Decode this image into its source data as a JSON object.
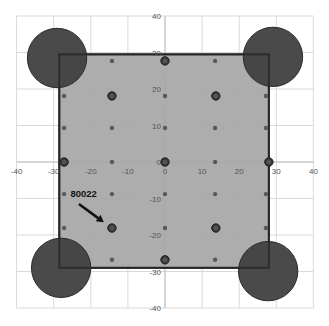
{
  "chart_data": {
    "type": "scatter",
    "title": "",
    "xlabel": "",
    "ylabel": "",
    "xlim": [
      -40,
      40
    ],
    "ylim": [
      -40,
      40
    ],
    "grid": true,
    "legend": null,
    "x_ticks": [
      -40,
      -30,
      -20,
      -10,
      0,
      10,
      20,
      30,
      40
    ],
    "y_ticks": [
      -40,
      -30,
      -20,
      -10,
      0,
      10,
      20,
      30,
      40
    ],
    "colors": {
      "grid": "#d9d9d9",
      "axis": "#bfbfbf",
      "square_fill": "#a6a6a6",
      "square_stroke": "#262626",
      "large_circle_fill": "#404040",
      "large_circle_stroke": "#2a2a2a",
      "small_dot": "#595959",
      "medium_dot": "#3a3a3a",
      "annotation": "#111111"
    },
    "square": {
      "x_min": -28.5,
      "x_max": 28,
      "y_min": -29,
      "y_max": 29.5
    },
    "series": [
      {
        "name": "large circles",
        "radius_units": 8,
        "points": [
          {
            "x": -29.1,
            "y": 28.5
          },
          {
            "x": 29.1,
            "y": 28.8
          },
          {
            "x": -28.0,
            "y": -29.0
          },
          {
            "x": 27.8,
            "y": -29.9
          }
        ]
      },
      {
        "name": "medium dots",
        "points": [
          {
            "x": 0,
            "y": 27.7
          },
          {
            "x": -14.3,
            "y": 18.1
          },
          {
            "x": 13.7,
            "y": 18.1
          },
          {
            "x": -27.2,
            "y": 0
          },
          {
            "x": 0,
            "y": 0
          },
          {
            "x": 28.0,
            "y": 0
          },
          {
            "x": -14.3,
            "y": -18.1
          },
          {
            "x": 13.7,
            "y": -18.1
          },
          {
            "x": 0,
            "y": -26.8
          }
        ]
      },
      {
        "name": "small dots",
        "points": [
          {
            "x": -14.3,
            "y": 27.7
          },
          {
            "x": 13.5,
            "y": 27.7
          },
          {
            "x": -27.2,
            "y": 18.1
          },
          {
            "x": 0,
            "y": 18.1
          },
          {
            "x": 27.2,
            "y": 18.1
          },
          {
            "x": -27.2,
            "y": 9.3
          },
          {
            "x": -14.3,
            "y": 9.3
          },
          {
            "x": 0,
            "y": 9.3
          },
          {
            "x": 13.5,
            "y": 9.3
          },
          {
            "x": 27.2,
            "y": 9.3
          },
          {
            "x": -14.3,
            "y": 0
          },
          {
            "x": 13.5,
            "y": 0
          },
          {
            "x": -27.2,
            "y": -8.8
          },
          {
            "x": -14.3,
            "y": -8.8
          },
          {
            "x": 0,
            "y": -8.8
          },
          {
            "x": 13.5,
            "y": -8.8
          },
          {
            "x": 27.2,
            "y": -8.8
          },
          {
            "x": -27.2,
            "y": -18.1
          },
          {
            "x": 0,
            "y": -18.1
          },
          {
            "x": 27.2,
            "y": -18.1
          },
          {
            "x": -14.3,
            "y": -26.8
          },
          {
            "x": 13.5,
            "y": -26.8
          }
        ]
      }
    ],
    "annotations": [
      {
        "text": "80022",
        "text_x": -25.5,
        "text_y": -9.5,
        "arrow_from": {
          "x": -23.2,
          "y": -11.5
        },
        "arrow_to": {
          "x": -16.5,
          "y": -16.5
        }
      }
    ]
  }
}
